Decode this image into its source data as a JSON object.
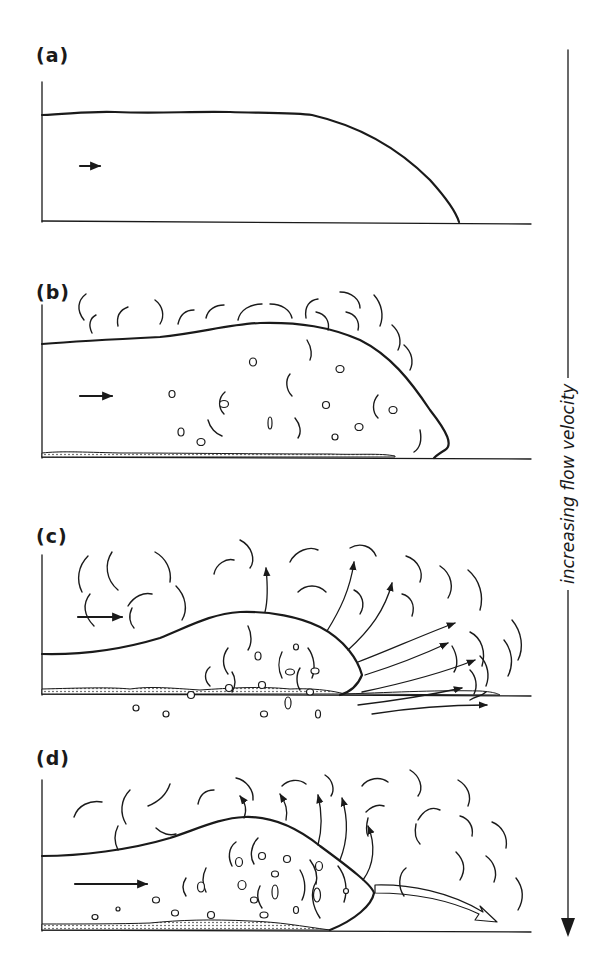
{
  "figure": {
    "panels": [
      {
        "id": "a",
        "label": "(a)",
        "description": "Flow head with smooth upper surface; no turbulence"
      },
      {
        "id": "b",
        "label": "(b)",
        "description": "Turbulent eddies above head; suspended clasts; thin basal deposit"
      },
      {
        "id": "c",
        "label": "(c)",
        "description": "Fluid escaping from head (arrows); dense clast population; basal deposit"
      },
      {
        "id": "d",
        "label": "(d)",
        "description": "Vigorous escape upward and a forward-directed jet at the head base"
      }
    ],
    "axis": {
      "label": "increasing flow velocity",
      "direction": "down",
      "arrow": "arrow-down"
    },
    "flow_arrow_icon": "arrow-right",
    "colors": {
      "ink": "#1a1a1a",
      "paper": "#ffffff"
    }
  }
}
